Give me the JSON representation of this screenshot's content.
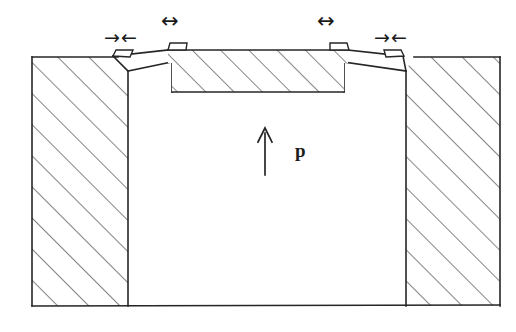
{
  "figure": {
    "type": "engineering-cross-section",
    "canvas": {
      "width": 516,
      "height": 332,
      "background": "#ffffff"
    },
    "stroke_color": "#262626",
    "hatch_color": "#3a3a3a",
    "labels": {
      "pressure": "p"
    },
    "annotations": [
      {
        "name": "left-converging-arrows",
        "glyph": "→←",
        "x": 103,
        "y": 30,
        "meaning": "compression-inward"
      },
      {
        "name": "left-span-arrow",
        "glyph": "↔",
        "x": 162,
        "y": 12,
        "meaning": "lateral-extent"
      },
      {
        "name": "right-span-arrow",
        "glyph": "↔",
        "x": 318,
        "y": 12,
        "meaning": "lateral-extent"
      },
      {
        "name": "right-converging-arrows",
        "glyph": "→←",
        "x": 373,
        "y": 30,
        "meaning": "compression-inward"
      },
      {
        "name": "pressure-arrow",
        "glyph": "↑",
        "x": 258,
        "y": 128,
        "meaning": "internal-pressure-direction"
      }
    ],
    "geometry": {
      "frame": {
        "x": 32,
        "y": 57,
        "right": 500,
        "bottom": 306
      },
      "left_block": {
        "left": 32,
        "right": 128,
        "top": 57,
        "bottom": 306,
        "hatched": true
      },
      "right_block": {
        "left": 406,
        "right": 500,
        "top": 57,
        "bottom": 306,
        "hatched": true
      },
      "cavity": {
        "left": 128,
        "right": 406,
        "top": 92,
        "bottom": 306,
        "hatched": false
      },
      "cover_plate": {
        "left": 168,
        "right": 348,
        "top": 50,
        "bottom": 92,
        "hatched": true
      },
      "tabs": [
        {
          "name": "tab-outer-left",
          "x": 121,
          "y": 57
        },
        {
          "name": "tab-inner-left",
          "x": 174,
          "y": 45
        },
        {
          "name": "tab-inner-right",
          "x": 341,
          "y": 45
        },
        {
          "name": "tab-outer-right",
          "x": 394,
          "y": 57
        }
      ]
    }
  }
}
